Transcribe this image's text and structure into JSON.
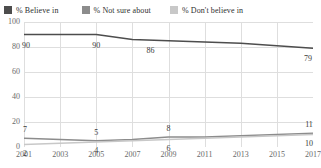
{
  "legend": {
    "items": [
      {
        "label": "% Believe in",
        "color": "#4d4d4d",
        "icon": "legend-swatch-icon"
      },
      {
        "label": "% Not sure about",
        "color": "#8c8c8c",
        "icon": "legend-swatch-icon"
      },
      {
        "label": "% Don't believe in",
        "color": "#c8c8c8",
        "icon": "legend-swatch-icon"
      }
    ]
  },
  "chart_data": {
    "type": "line",
    "title": "",
    "subtitle": "",
    "xlabel": "",
    "ylabel": "",
    "x": [
      2001,
      2003,
      2005,
      2007,
      2009,
      2011,
      2013,
      2015,
      2017
    ],
    "xtick_labels": [
      "2001",
      "2003",
      "2005",
      "2007",
      "2009",
      "2011",
      "2013",
      "2015",
      "2017"
    ],
    "xlim": [
      2001,
      2017
    ],
    "ylim": [
      0,
      100
    ],
    "yticks": [
      0,
      20,
      40,
      60,
      80,
      100
    ],
    "ytick_labels": [
      "0",
      "20",
      "40",
      "60",
      "80",
      "100"
    ],
    "grid": true,
    "legend_position": "top-left",
    "series": [
      {
        "name": "% Believe in",
        "color": "#4d4d4d",
        "values": [
          90,
          90,
          90,
          86,
          85,
          84,
          83,
          81,
          79
        ],
        "point_labels": [
          {
            "x": 2001,
            "y": 90,
            "text": "90"
          },
          {
            "x": 2005,
            "y": 90,
            "text": "90"
          },
          {
            "x": 2008,
            "y": 86,
            "text": "86"
          },
          {
            "x": 2017,
            "y": 79,
            "text": "79"
          }
        ]
      },
      {
        "name": "% Not sure about",
        "color": "#8c8c8c",
        "values": [
          7,
          6,
          5,
          6,
          8,
          8,
          9,
          10,
          11
        ],
        "point_labels": [
          {
            "x": 2001,
            "y": 7,
            "text": "7"
          },
          {
            "x": 2005,
            "y": 5,
            "text": "5"
          },
          {
            "x": 2009,
            "y": 8,
            "text": "8"
          },
          {
            "x": 2017,
            "y": 11,
            "text": "11"
          }
        ]
      },
      {
        "name": "% Don't believe in",
        "color": "#c8c8c8",
        "values": [
          2,
          3,
          4,
          5,
          6,
          7,
          8,
          9,
          10
        ],
        "point_labels": [
          {
            "x": 2001,
            "y": 2,
            "text": "2"
          },
          {
            "x": 2005,
            "y": 4,
            "text": "4"
          },
          {
            "x": 2009,
            "y": 6,
            "text": "6"
          },
          {
            "x": 2017,
            "y": 10,
            "text": "10"
          }
        ]
      }
    ],
    "label_offsets": {
      "series_0": [
        {
          "dx": 2,
          "dy": 11
        },
        {
          "dx": 0,
          "dy": 11
        },
        {
          "dx": 0,
          "dy": 11
        },
        {
          "dx": -5,
          "dy": 11
        }
      ],
      "series_1": [
        {
          "dx": 1,
          "dy": -8
        },
        {
          "dx": 0,
          "dy": -8
        },
        {
          "dx": 0,
          "dy": -8
        },
        {
          "dx": -4,
          "dy": -8
        }
      ],
      "series_2": [
        {
          "dx": 1,
          "dy": 9
        },
        {
          "dx": 0,
          "dy": 9
        },
        {
          "dx": 0,
          "dy": 9
        },
        {
          "dx": -4,
          "dy": 9
        }
      ]
    },
    "style": {
      "grid_color": "#dedede",
      "axis_label_color": "#6a6a6a",
      "point_label_color": "#3a3a3a",
      "background": "#ffffff",
      "line_width": 1.4
    }
  }
}
